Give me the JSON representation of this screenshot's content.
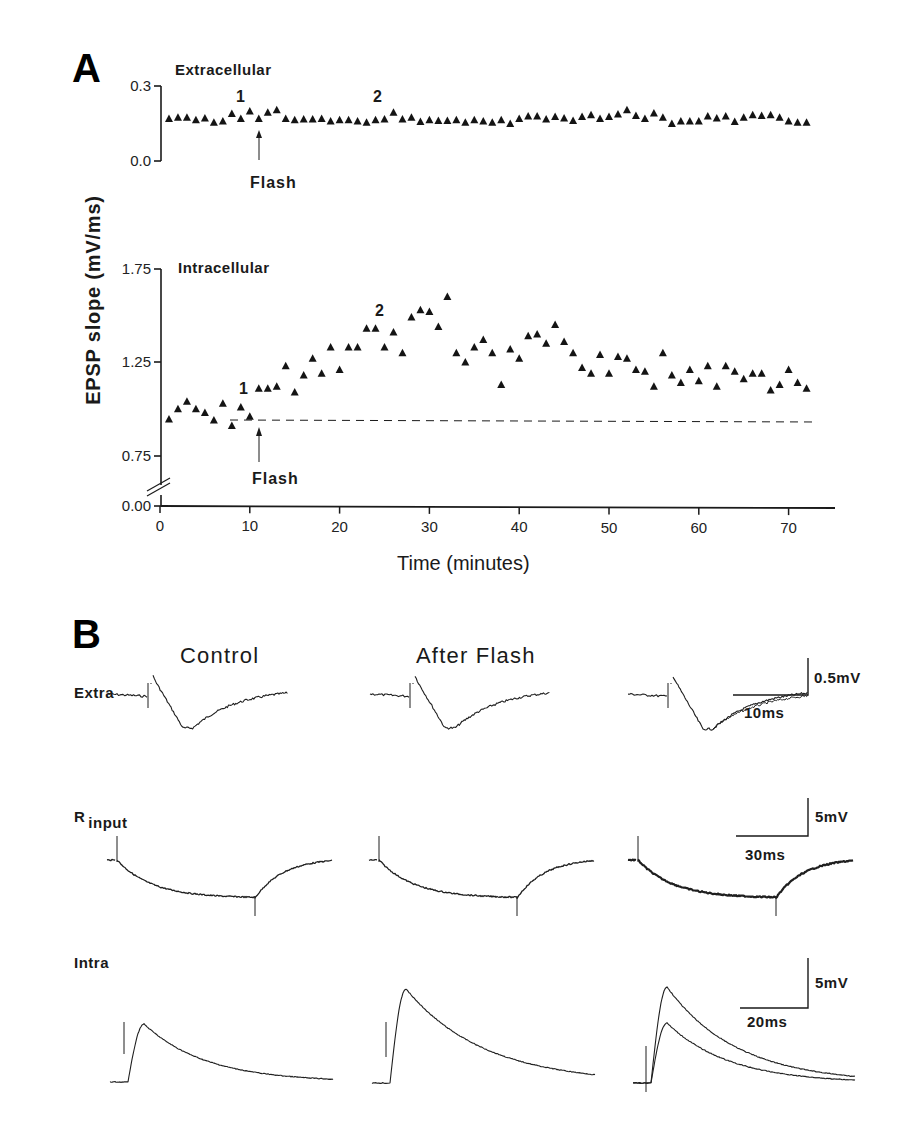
{
  "figure": {
    "panel_a_label": "A",
    "panel_b_label": "B"
  },
  "chart_data": [
    {
      "type": "scatter",
      "panel": "A-top",
      "title": "Extracellular",
      "xlabel": "Time (minutes)",
      "ylabel": "EPSP slope (mV/ms)",
      "xlim": [
        0,
        75
      ],
      "ylim": [
        0.0,
        0.3
      ],
      "yticks": [
        "0.0",
        "0.3"
      ],
      "grid": false,
      "marker": "filled-triangle",
      "annotations": [
        {
          "text": "1",
          "x": 9
        },
        {
          "text": "2",
          "x": 24
        },
        {
          "text": "Flash",
          "x": 11,
          "arrow": true
        }
      ],
      "x": [
        1,
        2,
        3,
        4,
        5,
        6,
        7,
        8,
        9,
        10,
        11,
        12,
        13,
        14,
        15,
        16,
        17,
        18,
        19,
        20,
        21,
        22,
        23,
        24,
        25,
        26,
        27,
        28,
        29,
        30,
        31,
        32,
        33,
        34,
        35,
        36,
        37,
        38,
        39,
        40,
        41,
        42,
        43,
        44,
        45,
        46,
        47,
        48,
        49,
        50,
        51,
        52,
        53,
        54,
        55,
        56,
        57,
        58,
        59,
        60,
        61,
        62,
        63,
        64,
        65,
        66,
        67,
        68,
        69,
        70,
        71,
        72
      ],
      "values": [
        0.17,
        0.175,
        0.175,
        0.165,
        0.172,
        0.155,
        0.16,
        0.19,
        0.17,
        0.2,
        0.17,
        0.195,
        0.205,
        0.17,
        0.165,
        0.168,
        0.168,
        0.17,
        0.16,
        0.165,
        0.165,
        0.16,
        0.155,
        0.165,
        0.168,
        0.195,
        0.168,
        0.175,
        0.158,
        0.165,
        0.162,
        0.162,
        0.165,
        0.155,
        0.165,
        0.16,
        0.155,
        0.165,
        0.15,
        0.17,
        0.18,
        0.18,
        0.168,
        0.178,
        0.172,
        0.162,
        0.178,
        0.185,
        0.17,
        0.178,
        0.188,
        0.205,
        0.182,
        0.17,
        0.192,
        0.175,
        0.15,
        0.16,
        0.16,
        0.16,
        0.18,
        0.172,
        0.18,
        0.158,
        0.175,
        0.185,
        0.182,
        0.185,
        0.175,
        0.16,
        0.155,
        0.155
      ]
    },
    {
      "type": "scatter",
      "panel": "A-bottom",
      "title": "Intracellular",
      "xlabel": "Time (minutes)",
      "ylabel": "EPSP slope (mV/ms)",
      "xlim": [
        0,
        75
      ],
      "ylim": [
        0.0,
        1.75
      ],
      "axis_break": "between 0.00 and 0.75",
      "xticks": [
        "0",
        "10",
        "20",
        "30",
        "40",
        "50",
        "60",
        "70"
      ],
      "yticks": [
        "0.00",
        "0.75",
        "1.25",
        "1.75"
      ],
      "grid": false,
      "marker": "filled-triangle",
      "baseline_dashed": 0.945,
      "annotations": [
        {
          "text": "1",
          "x": 9
        },
        {
          "text": "2",
          "x": 24
        },
        {
          "text": "Flash",
          "x": 11,
          "arrow": true
        }
      ],
      "x": [
        1,
        2,
        3,
        4,
        5,
        6,
        7,
        8,
        9,
        10,
        11,
        12,
        13,
        14,
        15,
        16,
        17,
        18,
        19,
        20,
        21,
        22,
        23,
        24,
        25,
        26,
        27,
        28,
        29,
        30,
        31,
        32,
        33,
        34,
        35,
        36,
        37,
        38,
        39,
        40,
        41,
        42,
        43,
        44,
        45,
        46,
        47,
        48,
        49,
        50,
        51,
        52,
        53,
        54,
        55,
        56,
        57,
        58,
        59,
        60,
        61,
        62,
        63,
        64,
        65,
        66,
        67,
        68,
        69,
        70,
        71,
        72
      ],
      "values": [
        0.945,
        1.0,
        1.04,
        1.0,
        0.98,
        0.94,
        1.03,
        0.91,
        1.01,
        0.96,
        1.11,
        1.11,
        1.12,
        1.23,
        1.09,
        1.18,
        1.27,
        1.19,
        1.33,
        1.21,
        1.33,
        1.33,
        1.43,
        1.43,
        1.33,
        1.41,
        1.3,
        1.49,
        1.53,
        1.52,
        1.44,
        1.6,
        1.3,
        1.25,
        1.33,
        1.37,
        1.3,
        1.13,
        1.32,
        1.27,
        1.39,
        1.4,
        1.35,
        1.45,
        1.36,
        1.3,
        1.22,
        1.19,
        1.29,
        1.19,
        1.28,
        1.27,
        1.21,
        1.2,
        1.12,
        1.3,
        1.18,
        1.14,
        1.21,
        1.15,
        1.23,
        1.12,
        1.23,
        1.2,
        1.16,
        1.19,
        1.19,
        1.1,
        1.13,
        1.21,
        1.14,
        1.11
      ]
    },
    {
      "type": "line",
      "panel": "B",
      "title": "Representative traces",
      "columns": [
        "Control",
        "After Flash",
        "Superimposed"
      ],
      "rows": [
        {
          "label": "Extra",
          "scale_v": "0.5mV",
          "scale_t": "10ms"
        },
        {
          "label_main": "R",
          "label_sub": "input",
          "scale_v": "5mV",
          "scale_t": "30ms"
        },
        {
          "label": "Intra",
          "scale_v": "5mV",
          "scale_t": "20ms"
        }
      ]
    }
  ],
  "panel_a": {
    "ylabel": "EPSP slope (mV/ms)",
    "xlabel": "Time (minutes)",
    "top": {
      "title": "Extracellular",
      "ytick_top": "0.3",
      "ytick_bottom": "0.0",
      "mark1": "1",
      "mark2": "2",
      "flash": "Flash"
    },
    "bottom": {
      "title": "Intracellular",
      "yticks": [
        "1.75",
        "1.25",
        "0.75",
        "0.00"
      ],
      "xticks": [
        "0",
        "10",
        "20",
        "30",
        "40",
        "50",
        "60",
        "70"
      ],
      "mark1": "1",
      "mark2": "2",
      "flash": "Flash"
    }
  },
  "panel_b": {
    "col_control": "Control",
    "col_after": "After Flash",
    "extra": {
      "label": "Extra",
      "scale_v": "0.5mV",
      "scale_t": "10ms"
    },
    "rinput": {
      "label_main": "R",
      "label_sub": "input",
      "scale_v": "5mV",
      "scale_t": "30ms"
    },
    "intra": {
      "label": "Intra",
      "scale_v": "5mV",
      "scale_t": "20ms"
    }
  }
}
